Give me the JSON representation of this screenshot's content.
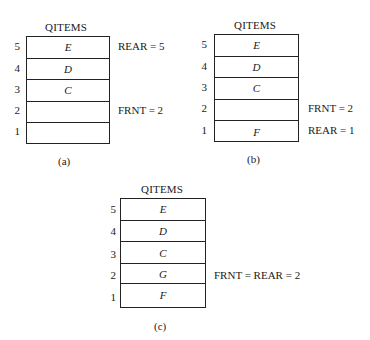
{
  "diagrams": [
    {
      "id": "a",
      "title": "QITEMS",
      "caption": "(a)",
      "rows": [
        {
          "index": "5",
          "value": "E"
        },
        {
          "index": "4",
          "value": "D"
        },
        {
          "index": "3",
          "value": "C"
        },
        {
          "index": "2",
          "value": ""
        },
        {
          "index": "1",
          "value": ""
        }
      ],
      "notes": {
        "row5": "REAR = 5",
        "row2": "FRNT = 2"
      }
    },
    {
      "id": "b",
      "title": "QITEMS",
      "caption": "(b)",
      "rows": [
        {
          "index": "5",
          "value": "E"
        },
        {
          "index": "4",
          "value": "D"
        },
        {
          "index": "3",
          "value": "C"
        },
        {
          "index": "2",
          "value": ""
        },
        {
          "index": "1",
          "value": "F"
        }
      ],
      "notes": {
        "row2": "FRNT = 2",
        "row1": "REAR = 1"
      }
    },
    {
      "id": "c",
      "title": "QITEMS",
      "caption": "(c)",
      "rows": [
        {
          "index": "5",
          "value": "E"
        },
        {
          "index": "4",
          "value": "D"
        },
        {
          "index": "3",
          "value": "C"
        },
        {
          "index": "2",
          "value": "G"
        },
        {
          "index": "1",
          "value": "F"
        }
      ],
      "notes": {
        "row2": "FRNT = REAR = 2"
      }
    }
  ]
}
